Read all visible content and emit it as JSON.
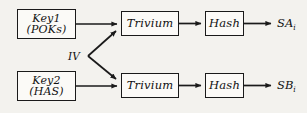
{
  "figure": {
    "type": "block-diagram",
    "background_color": "#f3f2ee",
    "line_color": "#1a1a1a",
    "box_fill": "#fbfaf7"
  },
  "nodes": {
    "key1": {
      "line1": "Key1",
      "line2": "(POKs)",
      "x": 17,
      "y": 9,
      "w": 59,
      "h": 30
    },
    "key2": {
      "line1": "Key2",
      "line2": "(HAS)",
      "x": 17,
      "y": 71,
      "w": 59,
      "h": 30
    },
    "trivium_top": {
      "label": "Trivium",
      "x": 121,
      "y": 11,
      "w": 58,
      "h": 25
    },
    "trivium_bottom": {
      "label": "Trivium",
      "x": 121,
      "y": 73,
      "w": 58,
      "h": 25
    },
    "hash_top": {
      "label": "Hash",
      "x": 205,
      "y": 11,
      "w": 39,
      "h": 25
    },
    "hash_bottom": {
      "label": "Hash",
      "x": 205,
      "y": 73,
      "w": 39,
      "h": 25
    }
  },
  "labels": {
    "iv": {
      "text": "IV",
      "x": 68,
      "y": 50
    },
    "output_top": {
      "base": "SA",
      "subscript": "i",
      "x": 277,
      "y": 16
    },
    "output_bottom": {
      "base": "SB",
      "subscript": "i",
      "x": 277,
      "y": 78
    }
  },
  "edges": [
    {
      "name": "key1-to-trivium-top",
      "from": "key1",
      "to": "trivium_top",
      "arrow": true
    },
    {
      "name": "trivium-top-to-hash-top",
      "from": "trivium_top",
      "to": "hash_top",
      "arrow": true
    },
    {
      "name": "hash-top-to-output-top",
      "from": "hash_top",
      "to": "output_top",
      "arrow": true
    },
    {
      "name": "key2-to-trivium-bottom",
      "from": "key2",
      "to": "trivium_bottom",
      "arrow": true
    },
    {
      "name": "trivium-bottom-to-hash-bottom",
      "from": "trivium_bottom",
      "to": "hash_bottom",
      "arrow": true
    },
    {
      "name": "hash-bottom-to-output-bottom",
      "from": "hash_bottom",
      "to": "output_bottom",
      "arrow": true
    },
    {
      "name": "iv-to-trivium-top",
      "from": "iv",
      "to": "trivium_top",
      "arrow": true
    },
    {
      "name": "iv-to-trivium-bottom",
      "from": "iv",
      "to": "trivium_bottom",
      "arrow": true
    }
  ]
}
